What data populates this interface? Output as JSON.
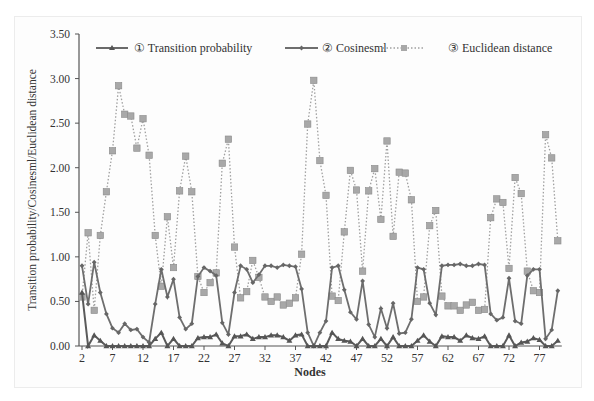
{
  "chart_data": {
    "type": "line",
    "title": "",
    "xlabel": "Nodes",
    "ylabel": "Transition probability/Cosinesml/Euclidean distance",
    "ylim": [
      0,
      3.5
    ],
    "yticks": [
      "0.00",
      "0.50",
      "1.00",
      "1.50",
      "2.00",
      "2.50",
      "3.00",
      "3.50"
    ],
    "xticks": [
      "2",
      "7",
      "12",
      "17",
      "22",
      "27",
      "32",
      "37",
      "42",
      "47",
      "52",
      "57",
      "62",
      "67",
      "72",
      "77"
    ],
    "grid": false,
    "legend_position": "top",
    "x": [
      2,
      3,
      4,
      5,
      6,
      7,
      8,
      9,
      10,
      11,
      12,
      13,
      14,
      15,
      16,
      17,
      18,
      19,
      20,
      21,
      22,
      23,
      24,
      25,
      26,
      27,
      28,
      29,
      30,
      31,
      32,
      33,
      34,
      35,
      36,
      37,
      38,
      39,
      40,
      41,
      42,
      43,
      44,
      45,
      46,
      47,
      48,
      49,
      50,
      51,
      52,
      53,
      54,
      55,
      56,
      57,
      58,
      59,
      60,
      61,
      62,
      63,
      64,
      65,
      66,
      67,
      68,
      69,
      70,
      71,
      72,
      73,
      74,
      75,
      76,
      77,
      78,
      79,
      80
    ],
    "series": [
      {
        "name": "① Transition probability",
        "marker": "triangle",
        "line": "solid",
        "color": "#5a5a5a",
        "values": [
          0.6,
          0.0,
          0.12,
          0.06,
          0.0,
          0.0,
          0.0,
          0.0,
          0.0,
          0.0,
          0.0,
          0.0,
          0.08,
          0.15,
          0.0,
          0.08,
          0.0,
          0.0,
          0.0,
          0.09,
          0.1,
          0.1,
          0.13,
          0.03,
          0.0,
          0.11,
          0.11,
          0.13,
          0.08,
          0.1,
          0.1,
          0.12,
          0.12,
          0.1,
          0.06,
          0.12,
          0.13,
          0.0,
          0.0,
          0.0,
          0.0,
          0.15,
          0.08,
          0.06,
          0.05,
          0.0,
          0.08,
          0.0,
          0.0,
          0.08,
          0.0,
          0.1,
          0.0,
          0.0,
          0.0,
          0.06,
          0.12,
          0.05,
          0.0,
          0.11,
          0.1,
          0.1,
          0.06,
          0.12,
          0.09,
          0.08,
          0.11,
          0.0,
          0.0,
          0.0,
          0.12,
          0.0,
          0.04,
          0.05,
          0.09,
          0.07,
          0.0,
          0.0,
          0.06
        ]
      },
      {
        "name": "② Cosinesml",
        "marker": "diamond",
        "line": "solid",
        "color": "#6e6e6e",
        "values": [
          0.9,
          0.47,
          0.94,
          0.6,
          0.36,
          0.2,
          0.15,
          0.25,
          0.18,
          0.19,
          0.1,
          0.04,
          0.47,
          0.86,
          0.55,
          0.75,
          0.32,
          0.19,
          0.25,
          0.78,
          0.88,
          0.84,
          0.79,
          0.26,
          0.13,
          0.6,
          0.9,
          0.86,
          0.71,
          0.8,
          0.9,
          0.9,
          0.88,
          0.91,
          0.9,
          0.89,
          0.64,
          0.15,
          0.0,
          0.15,
          0.28,
          0.88,
          0.9,
          0.63,
          0.38,
          0.3,
          0.73,
          0.24,
          0.1,
          0.42,
          0.2,
          0.48,
          0.14,
          0.15,
          0.3,
          0.88,
          0.86,
          0.48,
          0.35,
          0.9,
          0.91,
          0.91,
          0.92,
          0.9,
          0.9,
          0.92,
          0.91,
          0.36,
          0.29,
          0.32,
          0.76,
          0.28,
          0.25,
          0.79,
          0.86,
          0.86,
          0.08,
          0.18,
          0.62
        ]
      },
      {
        "name": "③ Euclidean distance",
        "marker": "square",
        "line": "dotted",
        "color": "#9a9a9a",
        "values": [
          0.55,
          1.27,
          0.4,
          1.24,
          1.73,
          2.19,
          2.92,
          2.6,
          2.58,
          2.22,
          2.55,
          2.14,
          1.24,
          0.67,
          1.45,
          0.88,
          1.74,
          2.13,
          1.73,
          0.78,
          0.6,
          0.71,
          0.82,
          2.05,
          2.32,
          1.11,
          0.54,
          0.61,
          0.96,
          0.77,
          0.55,
          0.5,
          0.55,
          0.46,
          0.48,
          0.54,
          1.03,
          2.49,
          2.98,
          2.08,
          1.69,
          0.56,
          0.51,
          1.28,
          1.97,
          1.75,
          0.84,
          1.74,
          1.99,
          1.42,
          2.3,
          1.23,
          1.95,
          1.94,
          1.64,
          0.5,
          0.55,
          1.35,
          1.52,
          0.56,
          0.45,
          0.45,
          0.4,
          0.46,
          0.49,
          0.4,
          0.41,
          1.44,
          1.65,
          1.61,
          0.87,
          1.89,
          1.71,
          0.84,
          0.62,
          0.6,
          2.37,
          2.11,
          1.18
        ]
      }
    ]
  },
  "legend": [
    {
      "label": "① Transition probability"
    },
    {
      "label": "② Cosinesml"
    },
    {
      "label": "③ Euclidean distance"
    }
  ],
  "axes": {
    "xlabel": "Nodes",
    "ylabel": "Transition probability/Cosinesml/Euclidean distance"
  }
}
